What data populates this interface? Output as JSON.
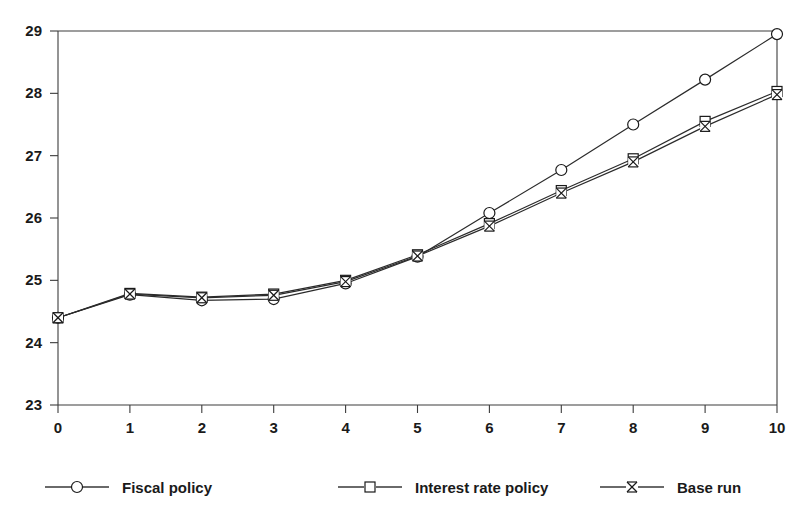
{
  "chart_data": {
    "type": "line",
    "title": "",
    "subtitle": "",
    "xlabel": "",
    "ylabel": "",
    "x": [
      0,
      1,
      2,
      3,
      4,
      5,
      6,
      7,
      8,
      9,
      10
    ],
    "xlim": [
      0,
      10
    ],
    "ylim": [
      23,
      29
    ],
    "xticks": [
      "0",
      "1",
      "2",
      "3",
      "4",
      "5",
      "6",
      "7",
      "8",
      "9",
      "10"
    ],
    "yticks": [
      "23",
      "24",
      "25",
      "26",
      "27",
      "28",
      "29"
    ],
    "grid": false,
    "legend_position": "bottom",
    "series": [
      {
        "name": "Fiscal policy",
        "marker": "circle",
        "values": [
          24.4,
          24.77,
          24.68,
          24.7,
          24.95,
          25.38,
          26.08,
          26.77,
          27.5,
          28.22,
          28.95
        ]
      },
      {
        "name": "Interest rate policy",
        "marker": "square",
        "values": [
          24.4,
          24.79,
          24.73,
          24.78,
          25.0,
          25.41,
          25.91,
          26.44,
          26.95,
          27.55,
          28.03
        ]
      },
      {
        "name": "Base run",
        "marker": "x",
        "values": [
          24.4,
          24.78,
          24.72,
          24.76,
          24.98,
          25.39,
          25.87,
          26.4,
          26.9,
          27.47,
          27.98
        ]
      }
    ]
  },
  "legend": {
    "items": [
      {
        "label": "Fiscal policy",
        "marker": "circle-marker"
      },
      {
        "label": "Interest rate policy",
        "marker": "square-marker"
      },
      {
        "label": "Base run",
        "marker": "x-marker"
      }
    ]
  },
  "colors": {
    "line": "#2b2b2b",
    "axis": "#3c3c3c",
    "text": "#1a1a1a",
    "background": "#ffffff"
  }
}
